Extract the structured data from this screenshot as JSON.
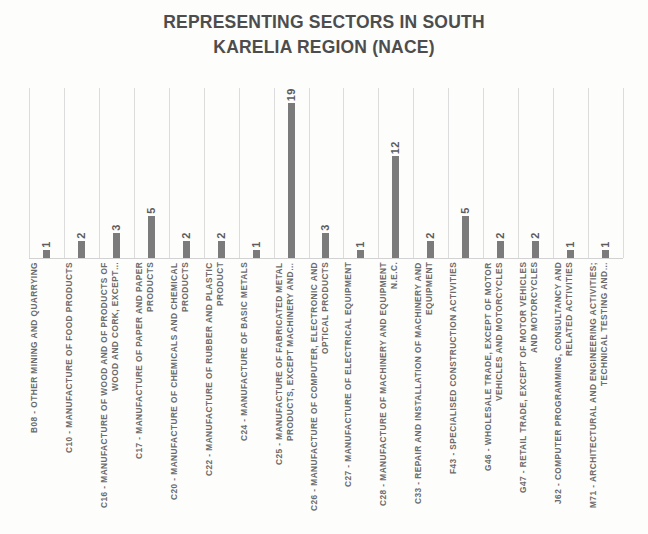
{
  "chart_data": {
    "type": "bar",
    "title": "REPRESENTING SECTORS IN SOUTH KARELIA REGION (NACE)",
    "title_line1": "REPRESENTING SECTORS IN SOUTH",
    "title_line2": "KARELIA REGION (NACE)",
    "xlabel": "",
    "ylabel": "",
    "ylim": [
      0,
      20
    ],
    "grid": true,
    "grid_orientation": "vertical",
    "legend": false,
    "orientation": "vertical",
    "data_labels": true,
    "categories": [
      "B08 - OTHER MINING AND QUARRYING",
      "C10 - MANUFACTURE OF FOOD PRODUCTS",
      "C16 - MANUFACTURE OF WOOD AND OF PRODUCTS OF WOOD AND CORK, EXCEPT…",
      "C17 - MANUFACTURE OF PAPER AND PAPER PRODUCTS",
      "C20 - MANUFACTURE OF CHEMICALS AND CHEMICAL PRODUCTS",
      "C22 - MANUFACTURE OF RUBBER AND PLASTIC PRODUCT",
      "C24 - MANUFACTURE OF BASIC METALS",
      "C25 - MANUFACTURE OF FABRICATED METAL PRODUCTS, EXCEPT MACHINERY AND…",
      "C26 - MANUFACTURE OF COMPUTER, ELECTRONIC AND OPTICAL PRODUCTS",
      "C27 - MANUFACTURE OF ELECTRICAL EQUIPMENT",
      "C28 - MANUFACTURE OF MACHINERY AND EQUIPMENT N.E.C.",
      "C33 - REPAIR AND INSTALLATION OF MACHINERY AND EQUIPMENT",
      "F43 - SPECIALISED CONSTRUCTION ACTIVITIES",
      "G46 - WHOLESALE TRADE, EXCEPT OF MOTOR VEHICLES AND MOTORCYCLES",
      "G47 - RETAIL TRADE, EXCEPT OF MOTOR VEHICLES AND MOTORCYCLES",
      "J62 - COMPUTER PROGRAMMING, CONSULTANCY AND RELATED ACTIVITIES",
      "M71 - ARCHITECTURAL AND ENGINEERING ACTIVITIES; TECHNICAL TESTING AND…"
    ],
    "values": [
      1,
      2,
      3,
      5,
      2,
      2,
      1,
      19,
      3,
      1,
      12,
      2,
      5,
      2,
      2,
      1,
      1
    ],
    "colors": {
      "bar": "#7b7b7b",
      "title": "#4d4d4d",
      "label": "#6b6b6b",
      "value_label": "#5c5c5c",
      "grid": "#dcdcdc",
      "background": "#fdfdfc"
    }
  }
}
